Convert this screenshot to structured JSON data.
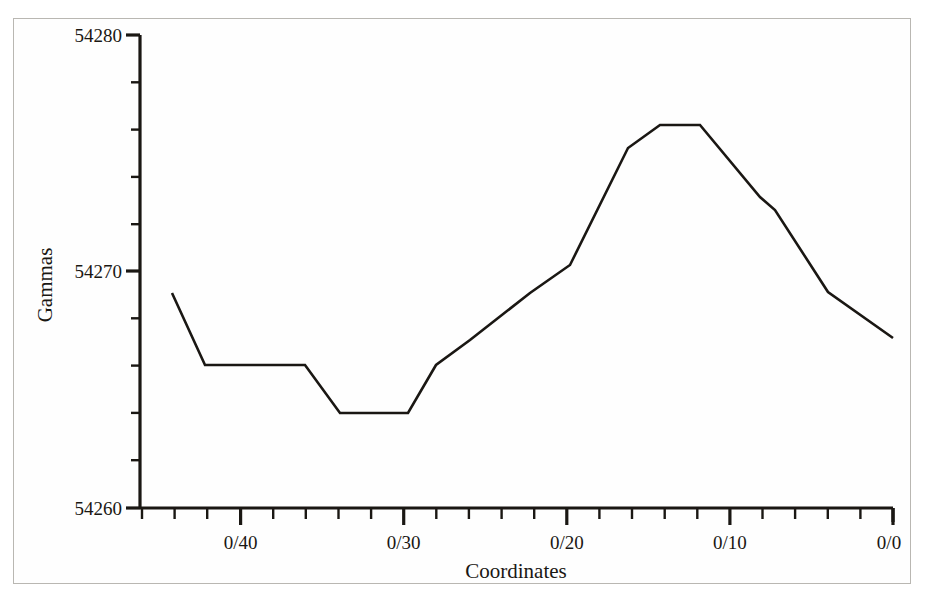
{
  "chart_data": {
    "type": "line",
    "title": "",
    "xlabel": "Coordinates",
    "ylabel": "Gammas",
    "ylim": [
      54260,
      54280
    ],
    "y_major_ticks": [
      54260,
      54270,
      54280
    ],
    "y_tick_labels": [
      "54260",
      "54270",
      "54280"
    ],
    "y_minor_step": 2,
    "grid": false,
    "legend": false,
    "x_major_tick_labels": [
      "0/40",
      "0/30",
      "0/20",
      "0/10",
      "0/0"
    ],
    "x_axis_direction": "descending",
    "x_minor_ticks_per_major": 4,
    "x_axis_start_label": "0/45",
    "x_axis_end_label": "0/0",
    "series": [
      {
        "name": "magnetic-profile",
        "x": [
          "0/44",
          "0/43",
          "0/41",
          "0/39",
          "0/37",
          "0/35",
          "0/34",
          "0/32",
          "0/30",
          "0/28",
          "0/26",
          "0/23",
          "0/20",
          "0/17",
          "0/14",
          "0/12",
          "0/9",
          "0/7",
          "0/4",
          "0/1"
        ],
        "values": [
          54269,
          54266,
          54266,
          54266,
          54264,
          54264,
          54264,
          54266,
          54267,
          54269,
          54271,
          54274,
          54276,
          54276,
          54275,
          54273,
          54273,
          54269,
          54267,
          54267
        ]
      }
    ],
    "pixel_vertices": [
      [
        172,
        293
      ],
      [
        205,
        365
      ],
      [
        265,
        365
      ],
      [
        305,
        365
      ],
      [
        340,
        413
      ],
      [
        408,
        413
      ],
      [
        436,
        365
      ],
      [
        470,
        340
      ],
      [
        530,
        293
      ],
      [
        570,
        265
      ],
      [
        628,
        148
      ],
      [
        660,
        125
      ],
      [
        700,
        125
      ],
      [
        760,
        197
      ],
      [
        775,
        210
      ],
      [
        828,
        292
      ],
      [
        893,
        338
      ]
    ]
  },
  "axis": {
    "y_label": "Gammas",
    "x_label": "Coordinates",
    "y_ticks": [
      {
        "label": "54280",
        "value": 54280
      },
      {
        "label": "54270",
        "value": 54270
      },
      {
        "label": "54260",
        "value": 54260
      }
    ],
    "x_ticks": [
      {
        "label": "0/40"
      },
      {
        "label": "0/30"
      },
      {
        "label": "0/20"
      },
      {
        "label": "0/10"
      },
      {
        "label": "0/0"
      }
    ]
  },
  "style": {
    "line_color": "#1a1713",
    "axis_color": "#1a1713",
    "background": "#fefefe",
    "frame_color": "#b9b7b2"
  }
}
